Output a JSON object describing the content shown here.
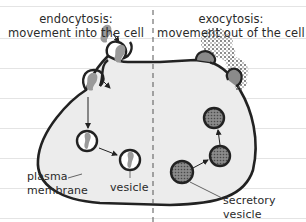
{
  "diagram": {
    "type": "biology-cell-transport",
    "left_panel": {
      "title_line1": "endocytosis:",
      "title_line2": "movement into the cell"
    },
    "right_panel": {
      "title_line1": "exocytosis:",
      "title_line2": "movement out of the cell"
    },
    "labels": {
      "plasma_membrane_line1": "plasma",
      "plasma_membrane_line2": "membrane",
      "vesicle": "vesicle",
      "secretory_vesicle_line1": "secretory",
      "secretory_vesicle_line2": "vesicle"
    },
    "colors": {
      "cell_fill": "#ececec",
      "membrane": "#222222",
      "cargo": "#9a9a9a",
      "secretory_fill": "#7a7a7a",
      "divider": "#555555",
      "ruled_line": "#e4e4e4"
    }
  }
}
